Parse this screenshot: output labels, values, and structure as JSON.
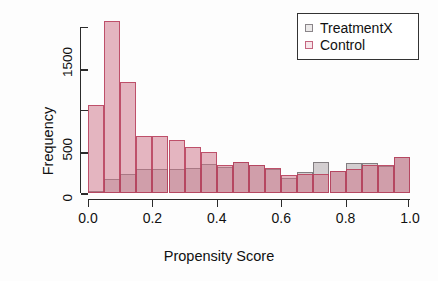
{
  "chart_data": {
    "type": "bar",
    "title": "",
    "subtitle": "",
    "xlabel": "Propensity Score",
    "ylabel": "Frequency",
    "xlim": [
      0.0,
      1.0
    ],
    "ylim": [
      0,
      2000
    ],
    "grid": false,
    "legend_position": "top-right",
    "bin_width": 0.05,
    "bin_starts": [
      0.0,
      0.05,
      0.1,
      0.15,
      0.2,
      0.25,
      0.3,
      0.35,
      0.4,
      0.45,
      0.5,
      0.55,
      0.6,
      0.65,
      0.7,
      0.75,
      0.8,
      0.85,
      0.9,
      0.95
    ],
    "categories": [
      "0.00-0.05",
      "0.05-0.10",
      "0.10-0.15",
      "0.15-0.20",
      "0.20-0.25",
      "0.25-0.30",
      "0.30-0.35",
      "0.35-0.40",
      "0.40-0.45",
      "0.45-0.50",
      "0.50-0.55",
      "0.55-0.60",
      "0.60-0.65",
      "0.65-0.70",
      "0.70-0.75",
      "0.75-0.80",
      "0.80-0.85",
      "0.85-0.90",
      "0.90-0.95",
      "0.95-1.00"
    ],
    "series": [
      {
        "name": "Control",
        "color": "#cd7388",
        "values": [
          1060,
          2070,
          1340,
          690,
          690,
          640,
          560,
          490,
          340,
          370,
          340,
          300,
          220,
          230,
          230,
          260,
          290,
          340,
          340,
          430
        ]
      },
      {
        "name": "TreatmentX",
        "color": "#bab2b4",
        "values": [
          30,
          170,
          230,
          290,
          290,
          290,
          300,
          350,
          310,
          370,
          340,
          290,
          180,
          250,
          370,
          260,
          360,
          360,
          330,
          430
        ]
      }
    ],
    "x_ticks": [
      {
        "value": 0.0,
        "label": "0.0"
      },
      {
        "value": 0.2,
        "label": "0.2"
      },
      {
        "value": 0.4,
        "label": "0.4"
      },
      {
        "value": 0.6,
        "label": "0.6"
      },
      {
        "value": 0.8,
        "label": "0.8"
      },
      {
        "value": 1.0,
        "label": "1.0"
      }
    ],
    "y_ticks": [
      {
        "value": 0,
        "label": "0",
        "major": true
      },
      {
        "value": 500,
        "label": "500",
        "major": true
      },
      {
        "value": 1000,
        "label": "",
        "major": false
      },
      {
        "value": 1500,
        "label": "1500",
        "major": true
      },
      {
        "value": 2000,
        "label": "",
        "major": false
      }
    ]
  },
  "axes": {
    "x_title": "Propensity Score",
    "y_title": "Frequency"
  },
  "legend": {
    "entries": [
      {
        "label": "TreatmentX",
        "key": "treatmentx-legend-key"
      },
      {
        "label": "Control",
        "key": "control-legend-key"
      }
    ]
  }
}
